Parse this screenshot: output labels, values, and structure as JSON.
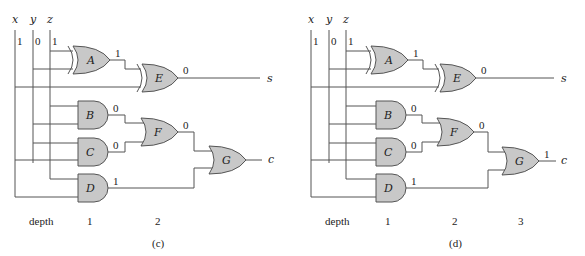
{
  "colors": {
    "gate_fill": "#c8c8c8",
    "wire": "#555555",
    "text": "#222222"
  },
  "panels": [
    {
      "id": "c",
      "caption": "(c)",
      "inputs": [
        {
          "name": "x",
          "value": "1"
        },
        {
          "name": "y",
          "value": "0"
        },
        {
          "name": "z",
          "value": "1"
        }
      ],
      "gates": [
        {
          "label": "A",
          "type": "XOR",
          "output": "1",
          "inputs": [
            "z",
            "y"
          ]
        },
        {
          "label": "B",
          "type": "AND",
          "output": "0",
          "inputs": [
            "z",
            "y"
          ]
        },
        {
          "label": "C",
          "type": "AND",
          "output": "0",
          "inputs": [
            "y",
            "x"
          ]
        },
        {
          "label": "D",
          "type": "AND",
          "output": "1",
          "inputs": [
            "z",
            "x"
          ]
        },
        {
          "label": "E",
          "type": "XOR",
          "output": "0",
          "inputs": [
            "A",
            "x"
          ]
        },
        {
          "label": "F",
          "type": "OR",
          "output": "0",
          "inputs": [
            "B",
            "C"
          ]
        },
        {
          "label": "G",
          "type": "OR",
          "output": "",
          "inputs": [
            "F",
            "D"
          ]
        }
      ],
      "outputs": [
        {
          "name": "s"
        },
        {
          "name": "c"
        }
      ],
      "depth_label": "depth",
      "depths": [
        "1",
        "2"
      ]
    },
    {
      "id": "d",
      "caption": "(d)",
      "inputs": [
        {
          "name": "x",
          "value": "1"
        },
        {
          "name": "y",
          "value": "0"
        },
        {
          "name": "z",
          "value": "1"
        }
      ],
      "gates": [
        {
          "label": "A",
          "type": "XOR",
          "output": "1",
          "inputs": [
            "z",
            "y"
          ]
        },
        {
          "label": "B",
          "type": "AND",
          "output": "0",
          "inputs": [
            "z",
            "y"
          ]
        },
        {
          "label": "C",
          "type": "AND",
          "output": "0",
          "inputs": [
            "y",
            "x"
          ]
        },
        {
          "label": "D",
          "type": "AND",
          "output": "1",
          "inputs": [
            "z",
            "x"
          ]
        },
        {
          "label": "E",
          "type": "XOR",
          "output": "0",
          "inputs": [
            "A",
            "x"
          ]
        },
        {
          "label": "F",
          "type": "OR",
          "output": "0",
          "inputs": [
            "B",
            "C"
          ]
        },
        {
          "label": "G",
          "type": "OR",
          "output": "1",
          "inputs": [
            "F",
            "D"
          ]
        }
      ],
      "outputs": [
        {
          "name": "s"
        },
        {
          "name": "c"
        }
      ],
      "depth_label": "depth",
      "depths": [
        "1",
        "2",
        "3"
      ]
    }
  ]
}
